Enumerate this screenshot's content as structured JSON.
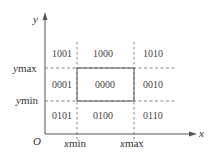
{
  "diagram": {
    "axes": {
      "x_label": "x",
      "y_label": "y",
      "origin_label": "O"
    },
    "boundaries": {
      "xmin_label": "xmin",
      "xmax_label": "xmax",
      "ymin_label": "ymin",
      "ymax_label": "ymax"
    },
    "regions": {
      "top_left": "1001",
      "top_center": "1000",
      "top_right": "1010",
      "middle_left": "0001",
      "center": "0000",
      "middle_right": "0010",
      "bottom_left": "0101",
      "bottom_center": "0100",
      "bottom_right": "0110"
    },
    "colors": {
      "axis": "#555555",
      "dashed": "#666666",
      "window": "#555555",
      "text": "#333333"
    }
  }
}
